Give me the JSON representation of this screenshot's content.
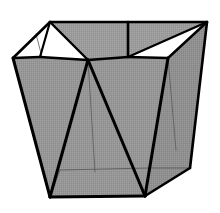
{
  "figure": {
    "name": "polyhedral-vessel",
    "description": "Grayscale line drawing of an open-topped faceted container viewed from above-front, wider at the rim than at the base",
    "canvas": {
      "width": 220,
      "height": 213
    },
    "colors": {
      "background": "#ffffff",
      "face_gray": "#969696",
      "face_gray_light": "#a0a0a0",
      "face_gray_dark": "#8c8c8c",
      "edge_black": "#000000",
      "edge_thin_gray": "#5a5a5a",
      "dither_dark": "#8a8a8a",
      "dither_light": "#a6a6a6"
    },
    "stroke_widths": {
      "heavy": 3.0,
      "medium": 2.0,
      "thin": 1.0,
      "hairline": 0.8
    },
    "vertices": {
      "rim_back_left": [
        50,
        22
      ],
      "rim_back_right": [
        207,
        22
      ],
      "rim_left": [
        13,
        58
      ],
      "rim_front_left": [
        88,
        60
      ],
      "rim_front_right": [
        168,
        58
      ],
      "rim_inner_left": [
        40,
        57
      ],
      "rim_inner_mid": [
        128,
        57
      ],
      "base_left": [
        50,
        197
      ],
      "base_front_right": [
        145,
        196
      ],
      "base_back_right": [
        190,
        168
      ],
      "base_inner_left": [
        60,
        170
      ],
      "base_inner_right": [
        150,
        168
      ],
      "base_mid": [
        120,
        172
      ]
    },
    "faces": [
      {
        "name": "front-left-panel",
        "shade": "#969696"
      },
      {
        "name": "front-right-panel",
        "shade": "#9a9a9a"
      },
      {
        "name": "right-side-panel",
        "shade": "#8f8f8f"
      },
      {
        "name": "interior-back-wall",
        "shade": "#979797"
      },
      {
        "name": "base-floor",
        "shade": "#949494"
      },
      {
        "name": "rim-band-back",
        "shade": "#9c9c9c"
      }
    ],
    "voids": [
      {
        "name": "opening-triangle-left",
        "fill": "#ffffff"
      },
      {
        "name": "opening-triangle-mid",
        "fill": "#ffffff"
      },
      {
        "name": "opening-sliver-right",
        "fill": "#ffffff"
      }
    ]
  }
}
